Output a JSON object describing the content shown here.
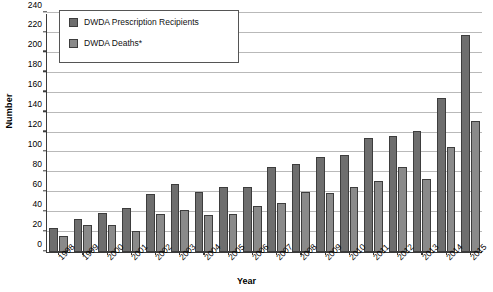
{
  "chart_data": {
    "type": "bar",
    "title": "",
    "xlabel": "Year",
    "ylabel": "Number",
    "ylim": [
      0,
      240
    ],
    "ytick_step": 20,
    "grid": true,
    "legend_position": "top-left",
    "categories": [
      "1998",
      "1999",
      "2000",
      "2001",
      "2002",
      "2003",
      "2004",
      "2005",
      "2006",
      "2007",
      "2008",
      "2009",
      "2010",
      "2011",
      "2012",
      "2013",
      "2014",
      "2015"
    ],
    "yticks": [
      "0",
      "20",
      "40",
      "60",
      "80",
      "100",
      "120",
      "140",
      "160",
      "180",
      "200",
      "220",
      "240"
    ],
    "series": [
      {
        "name": "DWDA Prescription Recipients",
        "color": "#6e6e6e",
        "values": [
          24,
          33,
          39,
          44,
          58,
          68,
          60,
          65,
          65,
          85,
          88,
          95,
          97,
          114,
          116,
          122,
          155,
          218
        ]
      },
      {
        "name": "DWDA Deaths*",
        "color": "#8a8a8a",
        "values": [
          16,
          27,
          27,
          21,
          38,
          42,
          37,
          38,
          46,
          49,
          60,
          59,
          65,
          71,
          85,
          73,
          105,
          132
        ]
      }
    ]
  }
}
